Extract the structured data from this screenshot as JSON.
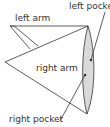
{
  "diagram": {
    "labels": {
      "left_arm": "left arm",
      "right_arm": "right arm",
      "left_pocket": "left pocket",
      "right_pocket": "right pocket"
    },
    "colors": {
      "stroke": "#333333",
      "lens_fill": "#d9d9d9",
      "background": "#ffffff"
    }
  }
}
